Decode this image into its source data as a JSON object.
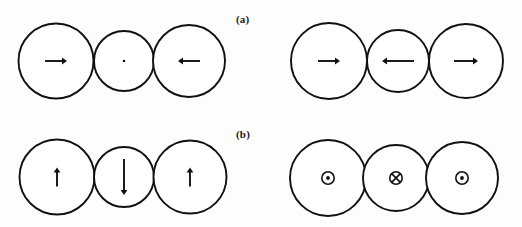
{
  "figure": {
    "width": 522,
    "height": 227,
    "background_color": "#fdfdfd",
    "stroke_color": "#111111"
  },
  "panels": [
    {
      "id": "panel-a",
      "label": "(a)",
      "label_x": 236,
      "label_y": 13,
      "groups": [
        {
          "id": "group-a-left",
          "circles": [
            {
              "cx": 56,
              "cy": 61,
              "r": 37.5,
              "marker": "arrow-right",
              "arrow_length": 22
            },
            {
              "cx": 124,
              "cy": 61,
              "r": 30.0,
              "marker": "dot",
              "arrow_length": 0
            },
            {
              "cx": 189,
              "cy": 61,
              "r": 36.0,
              "marker": "arrow-left",
              "arrow_length": 22
            }
          ]
        },
        {
          "id": "group-a-right",
          "circles": [
            {
              "cx": 329,
              "cy": 61,
              "r": 38.0,
              "marker": "arrow-right",
              "arrow_length": 22
            },
            {
              "cx": 398,
              "cy": 61,
              "r": 31.0,
              "marker": "arrow-left",
              "arrow_length": 32
            },
            {
              "cx": 466,
              "cy": 61,
              "r": 37.0,
              "marker": "arrow-right",
              "arrow_length": 24
            }
          ]
        }
      ]
    },
    {
      "id": "panel-b",
      "label": "(b)",
      "label_x": 236,
      "label_y": 128,
      "groups": [
        {
          "id": "group-b-left",
          "circles": [
            {
              "cx": 57,
              "cy": 177,
              "r": 37.5,
              "marker": "arrow-up",
              "arrow_length": 19
            },
            {
              "cx": 124,
              "cy": 177,
              "r": 30.0,
              "marker": "arrow-down",
              "arrow_length": 36
            },
            {
              "cx": 190,
              "cy": 177,
              "r": 36.5,
              "marker": "arrow-up",
              "arrow_length": 19
            }
          ]
        },
        {
          "id": "group-b-right",
          "circles": [
            {
              "cx": 328,
              "cy": 178,
              "r": 38.0,
              "marker": "circled-dot",
              "arrow_length": 0
            },
            {
              "cx": 396,
              "cy": 178,
              "r": 33.0,
              "marker": "circled-cross",
              "arrow_length": 0
            },
            {
              "cx": 462,
              "cy": 178,
              "r": 36.0,
              "marker": "circled-dot",
              "arrow_length": 0
            }
          ]
        }
      ]
    }
  ],
  "markers_legend": {
    "arrow-right": "moment pointing right (in plane)",
    "arrow-left": "moment pointing left (in plane)",
    "arrow-up": "moment pointing up (in plane)",
    "arrow-down": "moment pointing down (in plane)",
    "dot": "small central point (zero / undefined moment)",
    "circled-dot": "moment out of the page",
    "circled-cross": "moment into the page"
  }
}
